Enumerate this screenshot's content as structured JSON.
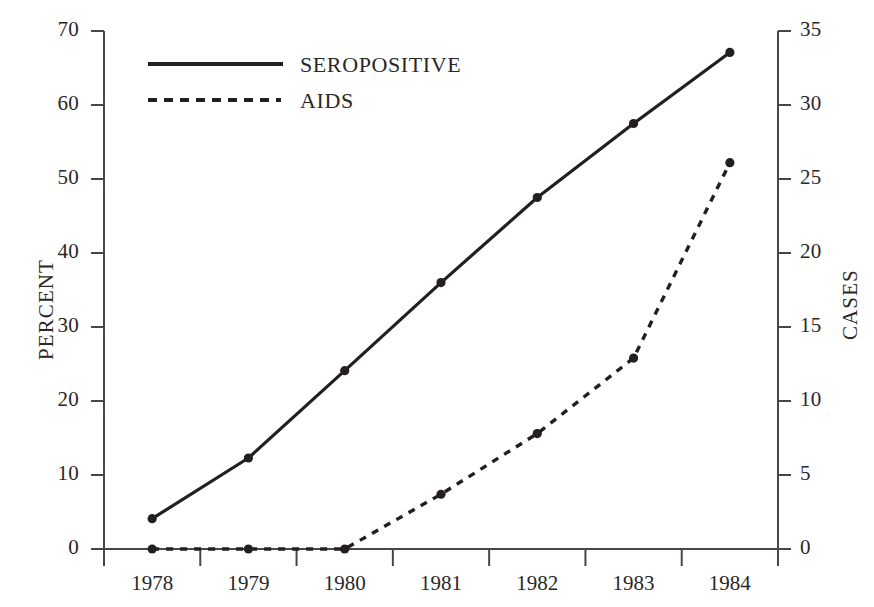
{
  "chart_data": {
    "type": "line",
    "title": "",
    "subtitle": "",
    "xlabel": "",
    "ylabel": "PERCENT",
    "y2label": "CASES",
    "categories": [
      "1978",
      "1979",
      "1980",
      "1981",
      "1982",
      "1983",
      "1984"
    ],
    "x": [
      1978,
      1979,
      1980,
      1981,
      1982,
      1983,
      1984
    ],
    "xlim": [
      1977.5,
      1984.5
    ],
    "ylim": [
      0,
      70
    ],
    "y2lim": [
      0,
      35
    ],
    "yticks": [
      "0",
      "10",
      "20",
      "30",
      "40",
      "50",
      "60",
      "70"
    ],
    "ytick_values": [
      0,
      10,
      20,
      30,
      40,
      50,
      60,
      70
    ],
    "y2ticks": [
      "0",
      "5",
      "10",
      "15",
      "20",
      "25",
      "30",
      "35"
    ],
    "y2tick_values": [
      0,
      5,
      10,
      15,
      20,
      25,
      30,
      35
    ],
    "grid": false,
    "legend_position": "top-left-inside",
    "series": [
      {
        "name": "SEROPOSITIVE",
        "axis": "left",
        "units": "percent",
        "style": "solid",
        "marker": "filled-circle",
        "color": "#231f20",
        "values": [
          4.1,
          12.3,
          24.1,
          36.0,
          47.5,
          57.5,
          67.1
        ]
      },
      {
        "name": "AIDS",
        "axis": "right",
        "units": "cases",
        "style": "dashed",
        "marker": "filled-circle",
        "color": "#231f20",
        "values": [
          0,
          0,
          0,
          3.7,
          7.8,
          12.9,
          26.1
        ]
      }
    ],
    "legend": [
      {
        "label": "SEROPOSITIVE",
        "style": "solid"
      },
      {
        "label": "AIDS",
        "style": "dashed"
      }
    ],
    "annotations": []
  },
  "axes": {
    "left_title": "PERCENT",
    "right_title": "CASES"
  },
  "colors": {
    "ink": "#231f20",
    "axis": "#4a4646",
    "background": "#ffffff"
  }
}
